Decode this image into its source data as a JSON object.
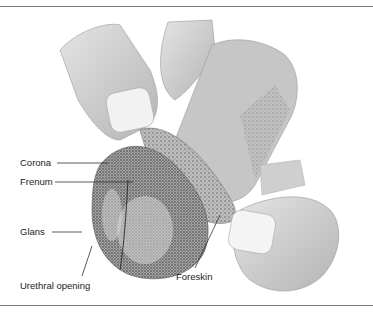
{
  "figure": {
    "labels": [
      {
        "id": "corona",
        "text": "Corona"
      },
      {
        "id": "frenum",
        "text": "Frenum"
      },
      {
        "id": "glans",
        "text": "Glans"
      },
      {
        "id": "urethral_opening",
        "text": "Urethral opening"
      },
      {
        "id": "foreskin",
        "text": "Foreskin"
      }
    ],
    "colors": {
      "skin_light": "#d6d6d6",
      "skin_mid": "#b8b8b8",
      "skin_dark": "#8c8c8c",
      "nail": "#f2f2f2",
      "line": "#333333",
      "rule": "#7a7a7a"
    }
  }
}
